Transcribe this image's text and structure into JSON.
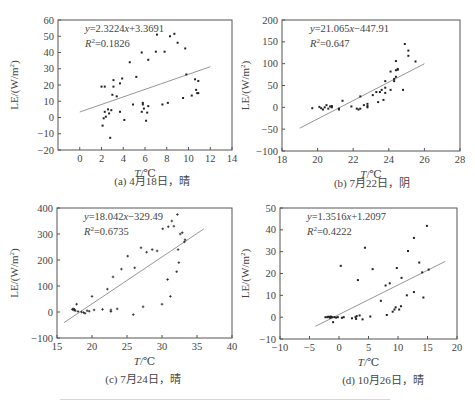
{
  "figure": {
    "ylabel_prefix": "LE/(W/m",
    "ylabel_sup": "2",
    "ylabel_suffix": ")",
    "xlabel_italic": "T",
    "xlabel_unit": "/℃"
  },
  "chart_data": [
    {
      "id": "a",
      "type": "scatter",
      "caption": "(a) 4月18日，晴",
      "title": "",
      "xlabel": "T/℃",
      "ylabel": "LE/(W/m²)",
      "xlim": [
        -2,
        14
      ],
      "ylim": [
        -20,
        60
      ],
      "xticks": [
        0,
        2,
        4,
        6,
        8,
        10,
        12,
        14
      ],
      "yticks": [
        -20,
        -10,
        0,
        10,
        20,
        30,
        40,
        50,
        60
      ],
      "grid": false,
      "equation": "y=2.3224x+3.3691",
      "r2": "R²=0.1826",
      "eq_parts": {
        "y": "y",
        "rest": "=2.3224",
        "x": "x",
        "tail": "+3.3691",
        "r": "R",
        "r2val": "=0.1826"
      },
      "trendline": {
        "slope": 2.3224,
        "intercept": 3.3691,
        "x_range": [
          0,
          12
        ]
      },
      "points": [
        [
          2.0,
          19
        ],
        [
          2.3,
          19
        ],
        [
          2.1,
          -5
        ],
        [
          2.2,
          -0.5
        ],
        [
          2.3,
          3.5
        ],
        [
          2.4,
          0.5
        ],
        [
          2.6,
          5
        ],
        [
          2.7,
          2.5
        ],
        [
          2.9,
          4.5
        ],
        [
          2.8,
          -12.5
        ],
        [
          3.0,
          14
        ],
        [
          3.1,
          19
        ],
        [
          3.1,
          23
        ],
        [
          3.4,
          13
        ],
        [
          3.7,
          21
        ],
        [
          3.7,
          3.5
        ],
        [
          3.9,
          24
        ],
        [
          4.1,
          -1.5
        ],
        [
          4.6,
          34
        ],
        [
          4.9,
          8
        ],
        [
          5.2,
          25
        ],
        [
          5.7,
          40
        ],
        [
          5.7,
          3.5
        ],
        [
          5.8,
          8
        ],
        [
          5.8,
          9
        ],
        [
          5.9,
          5.5
        ],
        [
          6.1,
          -2
        ],
        [
          6.2,
          3
        ],
        [
          6.3,
          7
        ],
        [
          6.3,
          35.5
        ],
        [
          7.0,
          40.5
        ],
        [
          7.1,
          51
        ],
        [
          7.6,
          8
        ],
        [
          7.8,
          40.5
        ],
        [
          8.1,
          9
        ],
        [
          8.3,
          50
        ],
        [
          8.7,
          51.5
        ],
        [
          9.0,
          46
        ],
        [
          9.5,
          12
        ],
        [
          9.7,
          42.5
        ],
        [
          9.8,
          26.5
        ],
        [
          10.3,
          13.5
        ],
        [
          10.6,
          23.5
        ],
        [
          10.7,
          17
        ],
        [
          10.8,
          15
        ],
        [
          10.9,
          15
        ],
        [
          10.9,
          22.5
        ]
      ]
    },
    {
      "id": "b",
      "type": "scatter",
      "caption": "(b) 7月22日，阴",
      "title": "",
      "xlabel": "T/℃",
      "ylabel": "LE/(W/m²)",
      "xlim": [
        18,
        28
      ],
      "ylim": [
        -100,
        200
      ],
      "xticks": [
        18,
        20,
        22,
        24,
        26,
        28
      ],
      "yticks": [
        -100,
        -50,
        0,
        50,
        100,
        150,
        200
      ],
      "grid": false,
      "equation": "y=21.065x-447.91",
      "r2": "R²=0.647",
      "eq_parts": {
        "y": "y",
        "rest": "=21.065",
        "x": "x",
        "tail": "−447.91",
        "r": "R",
        "r2val": "=0.647"
      },
      "trendline": {
        "slope": 21.065,
        "intercept": -447.91,
        "x_range": [
          19,
          26
        ]
      },
      "points": [
        [
          19.7,
          -2
        ],
        [
          20.1,
          1
        ],
        [
          20.2,
          -2
        ],
        [
          20.3,
          -5
        ],
        [
          20.4,
          0
        ],
        [
          20.5,
          5
        ],
        [
          20.6,
          -3
        ],
        [
          20.7,
          2
        ],
        [
          20.8,
          0
        ],
        [
          20.8,
          3
        ],
        [
          21.2,
          -5
        ],
        [
          21.2,
          -3
        ],
        [
          21.4,
          15
        ],
        [
          21.9,
          2
        ],
        [
          22.2,
          -3
        ],
        [
          22.3,
          -5
        ],
        [
          22.4,
          -3
        ],
        [
          22.4,
          25
        ],
        [
          22.6,
          5
        ],
        [
          22.8,
          0
        ],
        [
          22.8,
          3
        ],
        [
          22.8,
          8
        ],
        [
          23.1,
          28
        ],
        [
          23.3,
          35
        ],
        [
          23.4,
          12
        ],
        [
          23.5,
          35
        ],
        [
          23.6,
          40
        ],
        [
          23.7,
          17
        ],
        [
          23.8,
          33
        ],
        [
          23.8,
          45
        ],
        [
          23.8,
          60
        ],
        [
          24.1,
          40
        ],
        [
          24.1,
          82
        ],
        [
          24.3,
          60
        ],
        [
          24.3,
          65
        ],
        [
          24.4,
          70
        ],
        [
          24.4,
          85
        ],
        [
          24.4,
          106
        ],
        [
          24.5,
          88
        ],
        [
          24.5,
          86
        ],
        [
          24.8,
          40
        ],
        [
          24.9,
          145
        ],
        [
          25.1,
          118
        ],
        [
          25.1,
          130
        ],
        [
          25.5,
          105
        ]
      ]
    },
    {
      "id": "c",
      "type": "scatter",
      "caption": "(c) 7月24日，晴",
      "title": "",
      "xlabel": "T/℃",
      "ylabel": "LE/(W/m²)",
      "xlim": [
        15,
        40
      ],
      "ylim": [
        -100,
        400
      ],
      "xticks": [
        15,
        20,
        25,
        30,
        35,
        40
      ],
      "yticks": [
        -100,
        0,
        100,
        200,
        300,
        400
      ],
      "grid": false,
      "equation": "y=18.042x-329.49",
      "r2": "R²=0.6735",
      "eq_parts": {
        "y": "y",
        "rest": "=18.042",
        "x": "x",
        "tail": "−329.49",
        "r": "R",
        "r2val": "=0.6735"
      },
      "trendline": {
        "slope": 18.042,
        "intercept": -329.49,
        "x_range": [
          16,
          36
        ]
      },
      "points": [
        [
          17.2,
          10
        ],
        [
          17.3,
          12
        ],
        [
          17.4,
          8
        ],
        [
          17.5,
          10
        ],
        [
          17.6,
          5
        ],
        [
          17.8,
          30
        ],
        [
          18.0,
          2
        ],
        [
          18.5,
          0
        ],
        [
          18.8,
          -2
        ],
        [
          19.0,
          -5
        ],
        [
          19.3,
          5
        ],
        [
          19.6,
          3
        ],
        [
          20.0,
          60
        ],
        [
          20.3,
          8
        ],
        [
          21.5,
          10
        ],
        [
          22.2,
          88
        ],
        [
          22.7,
          2
        ],
        [
          22.7,
          8
        ],
        [
          23.0,
          135
        ],
        [
          23.6,
          12
        ],
        [
          24.2,
          165
        ],
        [
          25.1,
          215
        ],
        [
          25.9,
          -10
        ],
        [
          26.1,
          170
        ],
        [
          27.0,
          247
        ],
        [
          27.3,
          20
        ],
        [
          27.8,
          230
        ],
        [
          28.6,
          240
        ],
        [
          29.3,
          235
        ],
        [
          30.0,
          30
        ],
        [
          30.1,
          320
        ],
        [
          30.8,
          125
        ],
        [
          30.9,
          328
        ],
        [
          31.2,
          60
        ],
        [
          31.4,
          350
        ],
        [
          31.7,
          330
        ],
        [
          32.1,
          155
        ],
        [
          32.2,
          375
        ],
        [
          32.3,
          240
        ],
        [
          32.4,
          190
        ],
        [
          32.6,
          300
        ],
        [
          32.9,
          305
        ],
        [
          33.2,
          270
        ],
        [
          33.3,
          278
        ]
      ]
    },
    {
      "id": "d",
      "type": "scatter",
      "caption": "(d) 10月26日，晴",
      "title": "",
      "xlabel": "T/℃",
      "ylabel": "LE/(W/m²)",
      "xlim": [
        -10,
        20
      ],
      "ylim": [
        -10,
        50
      ],
      "xticks": [
        -10,
        -5,
        0,
        5,
        10,
        15,
        20
      ],
      "yticks": [
        -10,
        0,
        10,
        20,
        30,
        40,
        50
      ],
      "grid": false,
      "equation": "y=1.3516x+1.2097",
      "r2": "R²=0.4222",
      "eq_parts": {
        "y": "y",
        "rest": "=1.3516",
        "x": "x",
        "tail": "+1.2097",
        "r": "R",
        "r2val": "=0.4222"
      },
      "trendline": {
        "slope": 1.3516,
        "intercept": 1.2097,
        "x_range": [
          -4,
          18
        ]
      },
      "points": [
        [
          -2.3,
          0
        ],
        [
          -2.0,
          0
        ],
        [
          -1.8,
          0.2
        ],
        [
          -1.6,
          0
        ],
        [
          -1.5,
          -0.3
        ],
        [
          -1.4,
          0.3
        ],
        [
          -1.3,
          0
        ],
        [
          -1.2,
          0
        ],
        [
          -1.0,
          -2.3
        ],
        [
          -0.8,
          0
        ],
        [
          -0.5,
          -0.2
        ],
        [
          -0.2,
          0
        ],
        [
          0.3,
          23.5
        ],
        [
          0.5,
          -0.3
        ],
        [
          0.8,
          0
        ],
        [
          2.2,
          -0.5
        ],
        [
          2.8,
          0
        ],
        [
          2.9,
          -0.8
        ],
        [
          3.0,
          0.5
        ],
        [
          3.2,
          17
        ],
        [
          3.5,
          0.8
        ],
        [
          4.0,
          -1
        ],
        [
          4.4,
          31.8
        ],
        [
          5.3,
          0.3
        ],
        [
          5.7,
          22
        ],
        [
          7.1,
          7.5
        ],
        [
          7.9,
          14.5
        ],
        [
          8.1,
          1
        ],
        [
          8.6,
          15.5
        ],
        [
          9.1,
          2.5
        ],
        [
          9.4,
          3.5
        ],
        [
          9.6,
          4.5
        ],
        [
          9.8,
          22.5
        ],
        [
          10.2,
          3.5
        ],
        [
          10.5,
          5
        ],
        [
          10.6,
          18
        ],
        [
          11.5,
          10
        ],
        [
          11.7,
          30.3
        ],
        [
          12.7,
          36.3
        ],
        [
          12.7,
          11.5
        ],
        [
          13.6,
          25
        ],
        [
          14.1,
          20.5
        ],
        [
          14.3,
          9
        ],
        [
          14.9,
          41.8
        ],
        [
          15.2,
          21.8
        ]
      ]
    }
  ],
  "layout": {
    "panels": [
      {
        "frame": [
          58,
          20,
          232,
          150
        ],
        "caption_y": 185,
        "caption_cx": 152,
        "ylabel_x": 18
      },
      {
        "frame": [
          282,
          20,
          460,
          151
        ],
        "caption_y": 187,
        "caption_cx": 372,
        "ylabel_x": 249
      },
      {
        "frame": [
          57,
          208,
          232,
          338
        ],
        "caption_y": 383,
        "caption_cx": 143,
        "ylabel_x": 18
      },
      {
        "frame": [
          280,
          208,
          457,
          339
        ],
        "caption_y": 384,
        "caption_cx": 383,
        "ylabel_x": 249
      }
    ],
    "colors": {
      "axis": "#555555",
      "point": "#222222",
      "trend": "#8a8a8a",
      "text": "#444444"
    }
  }
}
